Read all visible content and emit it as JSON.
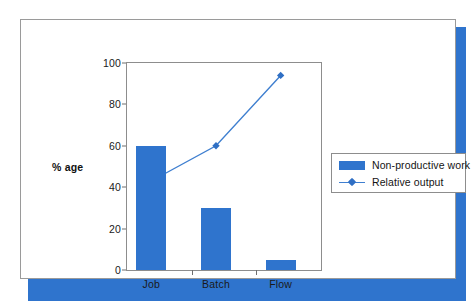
{
  "figure": {
    "panel_background": "#ffffff",
    "shadow_color": "#2f74cd",
    "frame_color": "#9a9a9a"
  },
  "chart_data": {
    "type": "bar",
    "title": "",
    "subtitle": "",
    "xlabel": "",
    "ylabel": "% age",
    "categories": [
      "Job",
      "Batch",
      "Flow"
    ],
    "ylim": [
      0,
      100
    ],
    "yticks": [
      0,
      20,
      40,
      60,
      80,
      100
    ],
    "ytick_labels": [
      "0",
      "20",
      "40",
      "60",
      "80",
      "100"
    ],
    "grid": false,
    "legend_position": "right",
    "series": [
      {
        "name": "Non-productive work",
        "type": "bar",
        "color": "#2f74cd",
        "values": [
          60,
          30,
          5
        ]
      },
      {
        "name": "Relative output",
        "type": "line",
        "color": "#3f7fd0",
        "marker": "diamond",
        "values": [
          43,
          60,
          94
        ]
      }
    ]
  },
  "legend": {
    "items": [
      {
        "label": "Non-productive work",
        "swatch": "bar-swatch",
        "color": "#2f74cd"
      },
      {
        "label": "Relative output",
        "swatch": "line-swatch",
        "color": "#3f7fd0"
      }
    ]
  }
}
